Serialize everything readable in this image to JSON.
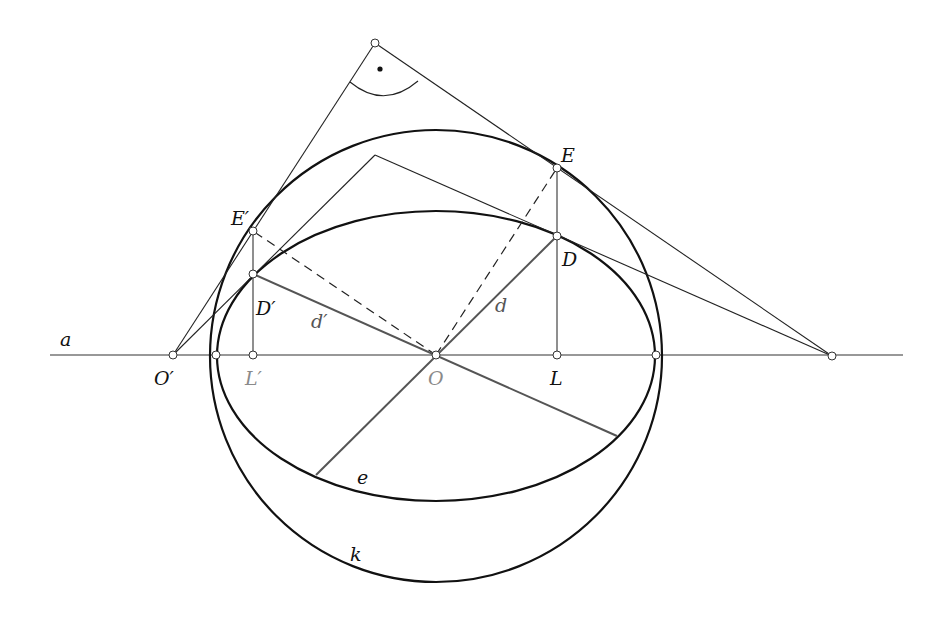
{
  "figure": {
    "labels": {
      "a": "a",
      "O_prime": "O′",
      "L_prime": "L′",
      "O": "O",
      "L": "L",
      "E": "E",
      "E_prime": "E′",
      "D": "D",
      "D_prime": "D′",
      "d": "d",
      "d_prime": "d′",
      "e": "e",
      "k": "k"
    },
    "colors": {
      "stroke": "#1a1a1a",
      "thin_stroke": "#333333",
      "grey_segment": "#555555",
      "grey_label": "#8a8a8a",
      "background": "#ffffff"
    },
    "geometry": {
      "axis_a": {
        "x1": 50,
        "y1": 355,
        "x2": 903,
        "y2": 355
      },
      "circle_k": {
        "cx": 436,
        "cy": 356,
        "r": 226
      },
      "ellipse_e": {
        "cx": 436,
        "cy": 356,
        "rx": 219,
        "ry": 145
      },
      "points": {
        "O_prime": [
          173,
          355
        ],
        "left_intersection": [
          216,
          355
        ],
        "L_prime": [
          253,
          355
        ],
        "O": [
          436,
          355
        ],
        "L": [
          557,
          355
        ],
        "right_intersection": [
          656,
          355
        ],
        "far_right": [
          832,
          356
        ],
        "E": [
          557,
          168
        ],
        "D": [
          557,
          236
        ],
        "E_prime": [
          253,
          231
        ],
        "D_prime": [
          253,
          274
        ],
        "apex_outer": [
          375,
          43
        ],
        "apex_inner": [
          375,
          155
        ],
        "d_end": [
          316,
          475
        ],
        "d_prime_end": [
          617,
          436
        ]
      }
    }
  }
}
